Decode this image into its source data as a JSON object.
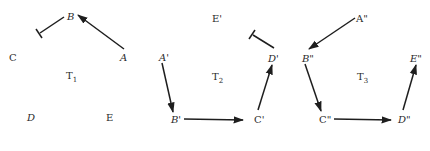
{
  "diagram": {
    "panels": [
      {
        "id": "T1",
        "title": "T",
        "subscript": "1",
        "nodes": [
          {
            "label": "B",
            "italic": true
          },
          {
            "label": "A",
            "italic": true
          },
          {
            "label": "C",
            "italic": false
          },
          {
            "label": "D",
            "italic": true
          },
          {
            "label": "E",
            "italic": false
          }
        ],
        "edges": [
          {
            "from": "A",
            "to": "B",
            "type": "arrow"
          },
          {
            "from": "B",
            "to": "",
            "type": "blocked"
          }
        ]
      },
      {
        "id": "T2",
        "title": "T",
        "subscript": "2",
        "nodes": [
          {
            "label": "E'",
            "italic": false
          },
          {
            "label": "A'",
            "italic": true
          },
          {
            "label": "D'",
            "italic": true
          },
          {
            "label": "B'",
            "italic": true
          },
          {
            "label": "C'",
            "italic": false
          }
        ],
        "edges": [
          {
            "from": "A'",
            "to": "B'",
            "type": "arrow"
          },
          {
            "from": "B'",
            "to": "C'",
            "type": "arrow"
          },
          {
            "from": "C'",
            "to": "D'",
            "type": "arrow"
          },
          {
            "from": "D'",
            "to": "",
            "type": "blocked"
          }
        ]
      },
      {
        "id": "T3",
        "title": "T",
        "subscript": "3",
        "nodes": [
          {
            "label": "A\"",
            "italic": false
          },
          {
            "label": "B\"",
            "italic": true
          },
          {
            "label": "E\"",
            "italic": true
          },
          {
            "label": "C\"",
            "italic": false
          },
          {
            "label": "D\"",
            "italic": true
          }
        ],
        "edges": [
          {
            "from": "A\"",
            "to": "B\"",
            "type": "arrow"
          },
          {
            "from": "B\"",
            "to": "C\"",
            "type": "arrow"
          },
          {
            "from": "C\"",
            "to": "D\"",
            "type": "arrow"
          },
          {
            "from": "D\"",
            "to": "E\"",
            "type": "arrow"
          }
        ]
      }
    ]
  }
}
